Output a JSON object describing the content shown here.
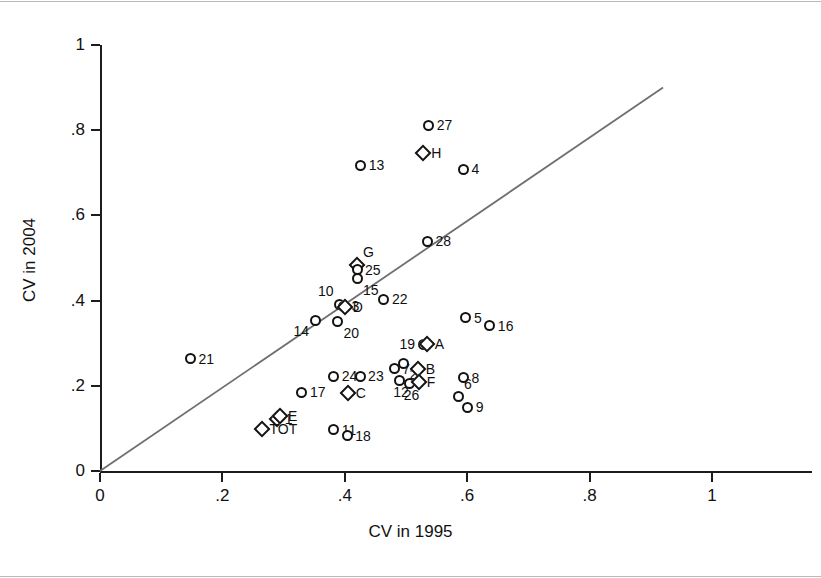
{
  "chart_data": {
    "type": "scatter",
    "title": "",
    "xlabel": "CV in 1995",
    "ylabel": "CV in 2004",
    "xlim": [
      0,
      1
    ],
    "ylim": [
      0,
      1
    ],
    "xticks": [
      "0",
      ".2",
      ".4",
      ".6",
      ".8",
      "1"
    ],
    "xtick_values": [
      0,
      0.2,
      0.4,
      0.6,
      0.8,
      1
    ],
    "yticks": [
      "0",
      ".2",
      ".4",
      ".6",
      ".8",
      "1"
    ],
    "ytick_values": [
      0,
      0.2,
      0.4,
      0.6,
      0.8,
      1
    ],
    "grid": false,
    "legend": "none",
    "annotations": [
      {
        "name": "identity-line",
        "type": "line",
        "description": "45-degree reference line y = x",
        "x": [
          0.0,
          0.92
        ],
        "y": [
          0.0,
          0.9
        ],
        "color": "#6f6f6f"
      }
    ],
    "marker_styles": {
      "circle": "numbered observations",
      "diamond": "lettered observations and TOT"
    },
    "points": [
      {
        "label": "21",
        "marker": "circle",
        "x": 0.148,
        "y": 0.263,
        "label_pos": "right"
      },
      {
        "label": "13",
        "marker": "circle",
        "x": 0.426,
        "y": 0.718,
        "label_pos": "right"
      },
      {
        "label": "27",
        "marker": "circle",
        "x": 0.537,
        "y": 0.812,
        "label_pos": "right"
      },
      {
        "label": "H",
        "marker": "diamond",
        "x": 0.528,
        "y": 0.747,
        "label_pos": "right"
      },
      {
        "label": "4",
        "marker": "circle",
        "x": 0.594,
        "y": 0.708,
        "label_pos": "right"
      },
      {
        "label": "28",
        "marker": "circle",
        "x": 0.535,
        "y": 0.539,
        "label_pos": "right"
      },
      {
        "label": "G",
        "marker": "diamond",
        "x": 0.42,
        "y": 0.483,
        "label_pos": "above-right"
      },
      {
        "label": "25",
        "marker": "circle",
        "x": 0.42,
        "y": 0.472,
        "label_pos": "right"
      },
      {
        "label": "15",
        "marker": "circle",
        "x": 0.42,
        "y": 0.451,
        "label_pos": "below-right"
      },
      {
        "label": "22",
        "marker": "circle",
        "x": 0.464,
        "y": 0.403,
        "label_pos": "right"
      },
      {
        "label": "10",
        "marker": "circle",
        "x": 0.392,
        "y": 0.392,
        "label_pos": "above-left"
      },
      {
        "label": "3",
        "marker": "circle",
        "x": 0.398,
        "y": 0.387,
        "label_pos": "right"
      },
      {
        "label": "D",
        "marker": "diamond",
        "x": 0.4,
        "y": 0.386,
        "label_pos": "right"
      },
      {
        "label": "14",
        "marker": "circle",
        "x": 0.352,
        "y": 0.354,
        "label_pos": "below-left"
      },
      {
        "label": "20",
        "marker": "circle",
        "x": 0.388,
        "y": 0.35,
        "label_pos": "below-right"
      },
      {
        "label": "5",
        "marker": "circle",
        "x": 0.598,
        "y": 0.36,
        "label_pos": "right"
      },
      {
        "label": "16",
        "marker": "circle",
        "x": 0.637,
        "y": 0.341,
        "label_pos": "right"
      },
      {
        "label": "19",
        "marker": "circle",
        "x": 0.528,
        "y": 0.297,
        "label_pos": "left"
      },
      {
        "label": "A",
        "marker": "diamond",
        "x": 0.534,
        "y": 0.297,
        "label_pos": "right"
      },
      {
        "label": "7",
        "marker": "circle",
        "x": 0.481,
        "y": 0.24,
        "label_pos": "right"
      },
      {
        "label": "2",
        "marker": "circle",
        "x": 0.496,
        "y": 0.253,
        "label_pos": "below-right"
      },
      {
        "label": "B",
        "marker": "diamond",
        "x": 0.519,
        "y": 0.239,
        "label_pos": "right"
      },
      {
        "label": "24",
        "marker": "circle",
        "x": 0.382,
        "y": 0.223,
        "label_pos": "right"
      },
      {
        "label": "23",
        "marker": "circle",
        "x": 0.425,
        "y": 0.223,
        "label_pos": "right"
      },
      {
        "label": "8",
        "marker": "circle",
        "x": 0.594,
        "y": 0.219,
        "label_pos": "right"
      },
      {
        "label": "12",
        "marker": "circle",
        "x": 0.489,
        "y": 0.213,
        "label_pos": "below"
      },
      {
        "label": "26",
        "marker": "circle",
        "x": 0.506,
        "y": 0.206,
        "label_pos": "below"
      },
      {
        "label": "F",
        "marker": "diamond",
        "x": 0.521,
        "y": 0.209,
        "label_pos": "right"
      },
      {
        "label": "17",
        "marker": "circle",
        "x": 0.33,
        "y": 0.185,
        "label_pos": "right"
      },
      {
        "label": "C",
        "marker": "diamond",
        "x": 0.405,
        "y": 0.183,
        "label_pos": "right"
      },
      {
        "label": "6",
        "marker": "circle",
        "x": 0.585,
        "y": 0.174,
        "label_pos": "above-right"
      },
      {
        "label": "9",
        "marker": "circle",
        "x": 0.601,
        "y": 0.15,
        "label_pos": "right"
      },
      {
        "label": "1",
        "marker": "diamond",
        "x": 0.289,
        "y": 0.123,
        "label_pos": "right"
      },
      {
        "label": "E",
        "marker": "diamond",
        "x": 0.294,
        "y": 0.13,
        "label_pos": "right"
      },
      {
        "label": "TOT",
        "marker": "diamond",
        "x": 0.264,
        "y": 0.098,
        "label_pos": "right"
      },
      {
        "label": "11",
        "marker": "circle",
        "x": 0.382,
        "y": 0.097,
        "label_pos": "right"
      },
      {
        "label": "18",
        "marker": "circle",
        "x": 0.404,
        "y": 0.083,
        "label_pos": "right"
      }
    ]
  }
}
